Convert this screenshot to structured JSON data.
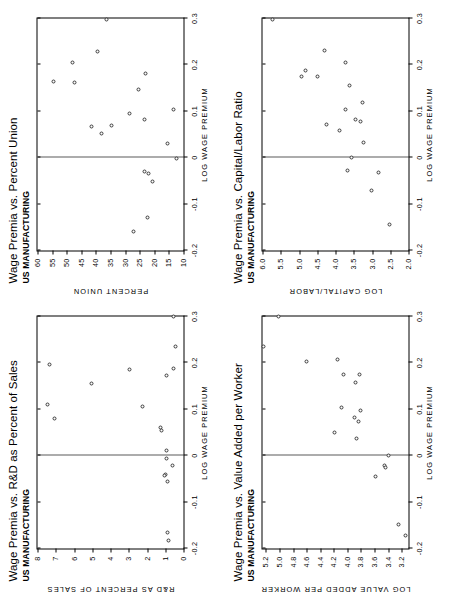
{
  "figure": {
    "page_orientation": "landscape-rotated-90",
    "panel_count": 4,
    "marker": "open-circle",
    "zero_reference_line": true
  },
  "chart_data": [
    {
      "type": "scatter",
      "panel": "top-left",
      "title": "Wage Premia vs. R&D as Percent of Sales",
      "subtitle": "US MANUFACTURING",
      "xlabel": "LOG WAGE PREMIUM",
      "ylabel": "R&D AS PERCENT OF SALES",
      "xlim": [
        -0.2,
        0.3
      ],
      "ylim": [
        0,
        8
      ],
      "xticks": [
        -0.2,
        -0.1,
        0,
        0.1,
        0.2,
        0.3
      ],
      "xticklabels": [
        "-0.2",
        "-0.1",
        "0",
        "0.1",
        "0.2",
        "0.3"
      ],
      "yticks": [
        0,
        1,
        2,
        3,
        4,
        5,
        6,
        7,
        8
      ],
      "yticklabels": [
        "0",
        "1",
        "2",
        "3",
        "4",
        "5",
        "6",
        "7",
        "8"
      ],
      "grid": false,
      "reference_line": {
        "axis": "x",
        "value": 0.0
      },
      "points": [
        {
          "x": 0.3,
          "y": 0.55
        },
        {
          "x": 0.235,
          "y": 0.45
        },
        {
          "x": 0.172,
          "y": 0.95
        },
        {
          "x": 0.188,
          "y": 0.55
        },
        {
          "x": 0.196,
          "y": 7.35
        },
        {
          "x": 0.185,
          "y": 2.95
        },
        {
          "x": 0.155,
          "y": 5.05
        },
        {
          "x": 0.11,
          "y": 7.45
        },
        {
          "x": 0.105,
          "y": 2.25
        },
        {
          "x": 0.08,
          "y": 7.05
        },
        {
          "x": 0.06,
          "y": 1.25
        },
        {
          "x": 0.055,
          "y": 1.2
        },
        {
          "x": 0.012,
          "y": 0.95
        },
        {
          "x": -0.005,
          "y": 0.95
        },
        {
          "x": -0.022,
          "y": 0.6
        },
        {
          "x": -0.04,
          "y": 1.0
        },
        {
          "x": -0.043,
          "y": 1.05
        },
        {
          "x": -0.055,
          "y": 0.9
        },
        {
          "x": -0.165,
          "y": 0.85
        },
        {
          "x": -0.182,
          "y": 0.8
        }
      ]
    },
    {
      "type": "scatter",
      "panel": "top-right",
      "title": "Wage Premia vs. Percent Union",
      "subtitle": "US MANUFACTURING",
      "xlabel": "LOG WAGE PREMIUM",
      "ylabel": "PERCENT UNION",
      "xlim": [
        -0.2,
        0.3
      ],
      "ylim": [
        10,
        60
      ],
      "xticks": [
        -0.2,
        -0.1,
        0,
        0.1,
        0.2,
        0.3
      ],
      "xticklabels": [
        "-0.2",
        "-0.1",
        "0",
        "0.1",
        "0.2",
        "0.3"
      ],
      "yticks": [
        10,
        15,
        20,
        25,
        30,
        35,
        40,
        45,
        50,
        55,
        60
      ],
      "yticklabels": [
        "10",
        "15",
        "20",
        "25",
        "30",
        "35",
        "40",
        "45",
        "50",
        "55",
        "60"
      ],
      "grid": false,
      "reference_line": {
        "axis": "x",
        "value": 0.0
      },
      "points": [
        {
          "x": 0.298,
          "y": 36.5
        },
        {
          "x": 0.228,
          "y": 39.5
        },
        {
          "x": 0.205,
          "y": 48.0
        },
        {
          "x": 0.182,
          "y": 23.0
        },
        {
          "x": 0.165,
          "y": 54.5
        },
        {
          "x": 0.163,
          "y": 47.5
        },
        {
          "x": 0.147,
          "y": 25.5
        },
        {
          "x": 0.103,
          "y": 13.5
        },
        {
          "x": 0.095,
          "y": 28.5
        },
        {
          "x": 0.082,
          "y": 23.5
        },
        {
          "x": 0.068,
          "y": 41.5
        },
        {
          "x": 0.07,
          "y": 34.5
        },
        {
          "x": 0.052,
          "y": 38.0
        },
        {
          "x": 0.03,
          "y": 15.5
        },
        {
          "x": -0.002,
          "y": 12.5
        },
        {
          "x": -0.03,
          "y": 23.5
        },
        {
          "x": -0.035,
          "y": 22.0
        },
        {
          "x": -0.052,
          "y": 20.5
        },
        {
          "x": -0.128,
          "y": 22.5
        },
        {
          "x": -0.16,
          "y": 27.0
        }
      ]
    },
    {
      "type": "scatter",
      "panel": "bottom-left",
      "title": "Wage Premia vs. Value Added per Worker",
      "subtitle": "US MANUFACTURING",
      "xlabel": "LOG WAGE PREMIUM",
      "ylabel": "LOG VALUE ADDED PER WORKER",
      "xlim": [
        -0.2,
        0.3
      ],
      "ylim": [
        3.1,
        5.25
      ],
      "xticks": [
        -0.2,
        -0.1,
        0,
        0.1,
        0.2,
        0.3
      ],
      "xticklabels": [
        "-0.2",
        "-0.1",
        "0",
        "0.1",
        "0.2",
        "0.3"
      ],
      "yticks": [
        3.2,
        3.4,
        3.6,
        3.8,
        4.0,
        4.2,
        4.4,
        4.6,
        4.8,
        5.0,
        5.2
      ],
      "yticklabels": [
        "3.2",
        "3.4",
        "3.6",
        "3.8",
        "4.0",
        "4.2",
        "4.4",
        "4.6",
        "4.8",
        "5.0",
        "5.2"
      ],
      "grid": false,
      "reference_line": {
        "axis": "x",
        "value": 0.0
      },
      "points": [
        {
          "x": 0.3,
          "y": 5.02
        },
        {
          "x": 0.236,
          "y": 5.24
        },
        {
          "x": 0.208,
          "y": 4.14
        },
        {
          "x": 0.204,
          "y": 4.6
        },
        {
          "x": 0.175,
          "y": 4.06
        },
        {
          "x": 0.174,
          "y": 3.82
        },
        {
          "x": 0.157,
          "y": 3.88
        },
        {
          "x": 0.104,
          "y": 4.08
        },
        {
          "x": 0.097,
          "y": 3.8
        },
        {
          "x": 0.082,
          "y": 3.9
        },
        {
          "x": 0.073,
          "y": 3.83
        },
        {
          "x": 0.05,
          "y": 4.19
        },
        {
          "x": 0.037,
          "y": 3.86
        },
        {
          "x": 0.0,
          "y": 3.4
        },
        {
          "x": -0.022,
          "y": 3.46
        },
        {
          "x": -0.026,
          "y": 3.44
        },
        {
          "x": -0.044,
          "y": 3.58
        },
        {
          "x": -0.148,
          "y": 3.25
        },
        {
          "x": -0.172,
          "y": 3.14
        }
      ]
    },
    {
      "type": "scatter",
      "panel": "bottom-right",
      "title": "Wage Premia vs. Capital/Labor Ratio",
      "subtitle": "US MANUFACTURING",
      "xlabel": "LOG WAGE PREMIUM",
      "ylabel": "LOG CAPITAL/LABOR",
      "xlim": [
        -0.2,
        0.3
      ],
      "ylim": [
        2.0,
        6.0
      ],
      "xticks": [
        -0.2,
        -0.1,
        0,
        0.1,
        0.2,
        0.3
      ],
      "xticklabels": [
        "-0.2",
        "-0.1",
        "0",
        "0.1",
        "0.2",
        "0.3"
      ],
      "yticks": [
        2.0,
        2.5,
        3.0,
        3.5,
        4.0,
        4.5,
        5.0,
        5.5,
        6.0
      ],
      "yticklabels": [
        "2.0",
        "2.5",
        "3.0",
        "3.5",
        "4.0",
        "4.5",
        "5.0",
        "5.5",
        "6.0"
      ],
      "grid": false,
      "reference_line": {
        "axis": "x",
        "value": 0.0
      },
      "points": [
        {
          "x": 0.298,
          "y": 5.72
        },
        {
          "x": 0.232,
          "y": 4.3
        },
        {
          "x": 0.206,
          "y": 3.72
        },
        {
          "x": 0.188,
          "y": 4.82
        },
        {
          "x": 0.175,
          "y": 4.92
        },
        {
          "x": 0.175,
          "y": 4.5
        },
        {
          "x": 0.155,
          "y": 3.62
        },
        {
          "x": 0.118,
          "y": 3.25
        },
        {
          "x": 0.103,
          "y": 3.72
        },
        {
          "x": 0.082,
          "y": 3.45
        },
        {
          "x": 0.078,
          "y": 3.32
        },
        {
          "x": 0.072,
          "y": 4.25
        },
        {
          "x": 0.058,
          "y": 3.9
        },
        {
          "x": 0.032,
          "y": 3.22
        },
        {
          "x": 0.0,
          "y": 3.55
        },
        {
          "x": -0.028,
          "y": 3.68
        },
        {
          "x": -0.032,
          "y": 2.82
        },
        {
          "x": -0.07,
          "y": 3.02
        },
        {
          "x": -0.145,
          "y": 2.52
        }
      ]
    }
  ]
}
